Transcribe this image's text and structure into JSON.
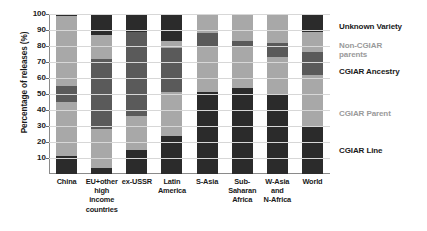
{
  "chart_data": {
    "type": "bar",
    "subtype": "stacked-bar-100",
    "title": "",
    "xlabel": "",
    "ylabel": "Percentage of releases (%)",
    "ylim": [
      0,
      100
    ],
    "yticks": [
      10,
      20,
      30,
      40,
      50,
      60,
      70,
      80,
      90,
      100
    ],
    "grid": true,
    "legend_position": "right",
    "categories": [
      "China",
      "EU+other high income countries",
      "ex-USSR",
      "Latin America",
      "S-Asia",
      "Sub-Saharan Africa",
      "W-Asia and N-Africa",
      "World"
    ],
    "category_label_lines": [
      [
        "China"
      ],
      [
        "EU+other",
        "high income",
        "countries"
      ],
      [
        "ex-USSR"
      ],
      [
        "Latin",
        "America"
      ],
      [
        "S-Asia"
      ],
      [
        "Sub-Saharan",
        "Africa"
      ],
      [
        "W-Asia",
        "and",
        "N-Africa"
      ],
      [
        "World"
      ]
    ],
    "series": [
      {
        "name": "CGIAR Line",
        "color": "#2b2b2b",
        "values": [
          11,
          4,
          15,
          24,
          51,
          54,
          50,
          30
        ]
      },
      {
        "name": "CGIAR Parent",
        "color": "#a8a8a8",
        "values": [
          34,
          24,
          21,
          27,
          29,
          26,
          23,
          32
        ]
      },
      {
        "name": "CGIAR Ancestry",
        "color": "#5a5a5a",
        "values": [
          10,
          44,
          53,
          28,
          8,
          3,
          9,
          14
        ]
      },
      {
        "name": "Non-CGIAR parents",
        "color": "#a8a8a8",
        "values": [
          44,
          15,
          0,
          4,
          12,
          17,
          18,
          13
        ]
      },
      {
        "name": "Unknown Variety",
        "color": "#2b2b2b",
        "values": [
          1,
          13,
          11,
          17,
          0,
          0,
          0,
          11
        ]
      }
    ]
  },
  "legend": {
    "entries": [
      {
        "label": "Unknown Variety",
        "color": "#1a1a1a",
        "top": 12
      },
      {
        "label": "Non-CGIAR\nparents",
        "color": "#9a9a9a",
        "top": 31
      },
      {
        "label": "CGIAR Ancestry",
        "color": "#1a1a1a",
        "top": 57
      },
      {
        "label": "CGIAR Parent",
        "color": "#9a9a9a",
        "top": 99
      },
      {
        "label": "CGIAR Line",
        "color": "#1a1a1a",
        "top": 136
      }
    ]
  }
}
